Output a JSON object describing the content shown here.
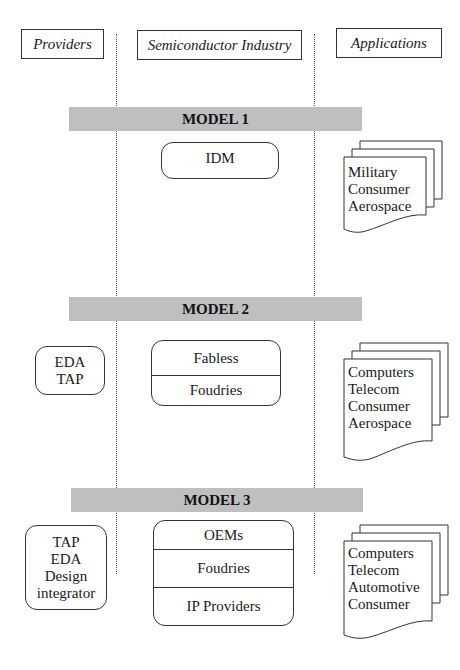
{
  "columns": {
    "providers": "Providers",
    "industry": "Semiconductor Industry",
    "applications": "Applications"
  },
  "models": [
    {
      "title": "MODEL 1",
      "providers": [],
      "industry": [
        "IDM"
      ],
      "applications": [
        "Military",
        "Consumer",
        "Aerospace"
      ]
    },
    {
      "title": "MODEL 2",
      "providers": [
        "EDA",
        "TAP"
      ],
      "industry": [
        "Fabless",
        "Foudries"
      ],
      "applications": [
        "Computers",
        "Telecom",
        "Consumer",
        "Aerospace"
      ]
    },
    {
      "title": "MODEL 3",
      "providers": [
        "TAP",
        "EDA",
        "Design",
        "integrator"
      ],
      "industry": [
        "OEMs",
        "Foudries",
        "IP Providers"
      ],
      "applications": [
        "Computers",
        "Telecom",
        "Automotive",
        "Consumer"
      ]
    }
  ]
}
